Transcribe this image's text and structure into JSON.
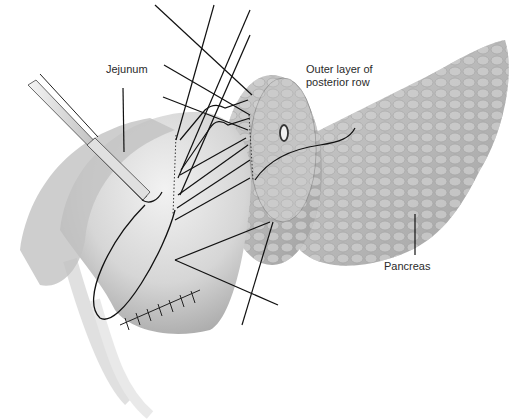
{
  "figure": {
    "labels": {
      "jejunum": "Jejunum",
      "outer_layer": "Outer layer of posterior row",
      "pancreas": "Pancreas"
    },
    "colors": {
      "background": "#ffffff",
      "tissue_light": "#e6e6e6",
      "tissue_mid": "#bdbdbd",
      "tissue_dark": "#8c8c8c",
      "suture": "#111111",
      "label_text": "#2a2a2a"
    }
  }
}
